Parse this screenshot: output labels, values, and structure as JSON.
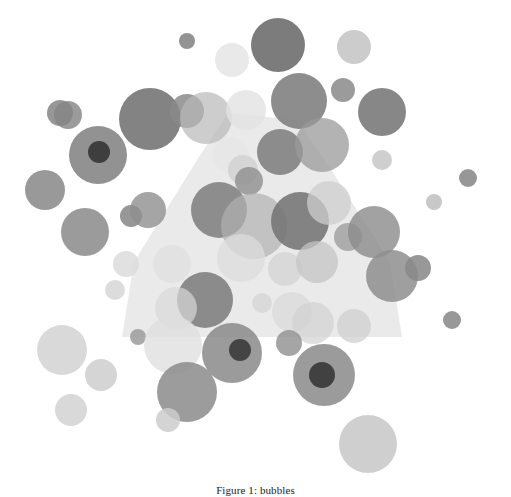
{
  "figure": {
    "caption": "Figure 1: bubbles",
    "background_color": "#ffffff"
  },
  "chart_data": {
    "type": "scatter",
    "title": "",
    "subtitle": "",
    "xlabel": "",
    "ylabel": "",
    "xlim": [
      0,
      511
    ],
    "ylim": [
      0,
      470
    ],
    "grid": false,
    "legend": "none",
    "axes_visible": false,
    "ticks": [],
    "tick_labels": [],
    "annotations": [],
    "marker_shape": "circle",
    "marker_colors": [
      "#808080",
      "#d9d9d9",
      "#a6a6a6",
      "#bfbfbf",
      "#737373"
    ],
    "marker_opacity_range": [
      0.45,
      0.95
    ],
    "overlay_shapes": [
      {
        "name": "light-polygon-hull",
        "type": "polygon",
        "color": "#d9d9d9",
        "opacity": 0.55,
        "points": "228,113 197,160 134,262 122,337 402,337 390,262 330,168 297,120"
      }
    ],
    "points": [
      {
        "x": 187,
        "y": 41,
        "r": 8,
        "c": "#808080",
        "o": 0.85
      },
      {
        "x": 278,
        "y": 45,
        "r": 27,
        "c": "#6e6e6e",
        "o": 0.9
      },
      {
        "x": 354,
        "y": 47,
        "r": 17,
        "c": "#c9c9c9",
        "o": 0.95
      },
      {
        "x": 68,
        "y": 115,
        "r": 14,
        "c": "#8a8a8a",
        "o": 0.85
      },
      {
        "x": 150,
        "y": 119,
        "r": 31,
        "c": "#757575",
        "o": 0.9
      },
      {
        "x": 187,
        "y": 111,
        "r": 17,
        "c": "#8a8a8a",
        "o": 0.85
      },
      {
        "x": 206,
        "y": 118,
        "r": 26,
        "c": "#b8b8b8",
        "o": 0.7
      },
      {
        "x": 246,
        "y": 110,
        "r": 20,
        "c": "#e2e2e2",
        "o": 0.8
      },
      {
        "x": 299,
        "y": 101,
        "r": 28,
        "c": "#7d7d7d",
        "o": 0.88
      },
      {
        "x": 343,
        "y": 90,
        "r": 12,
        "c": "#8a8a8a",
        "o": 0.85
      },
      {
        "x": 382,
        "y": 112,
        "r": 24,
        "c": "#7a7a7a",
        "o": 0.9
      },
      {
        "x": 60,
        "y": 113,
        "r": 13,
        "c": "#858585",
        "o": 0.85
      },
      {
        "x": 98,
        "y": 155,
        "r": 29,
        "c": "#7f7f7f",
        "o": 0.85
      },
      {
        "x": 99,
        "y": 152,
        "r": 11,
        "c": "#3a3a3a",
        "o": 0.95
      },
      {
        "x": 45,
        "y": 190,
        "r": 20,
        "c": "#878787",
        "o": 0.85
      },
      {
        "x": 231,
        "y": 155,
        "r": 18,
        "c": "#e6e6e6",
        "o": 0.8
      },
      {
        "x": 243,
        "y": 170,
        "r": 15,
        "c": "#cfcfcf",
        "o": 0.75
      },
      {
        "x": 280,
        "y": 152,
        "r": 23,
        "c": "#7b7b7b",
        "o": 0.85
      },
      {
        "x": 322,
        "y": 145,
        "r": 27,
        "c": "#9a9a9a",
        "o": 0.75
      },
      {
        "x": 382,
        "y": 160,
        "r": 10,
        "c": "#c7c7c7",
        "o": 0.85
      },
      {
        "x": 468,
        "y": 178,
        "r": 9,
        "c": "#8c8c8c",
        "o": 0.9
      },
      {
        "x": 85,
        "y": 232,
        "r": 24,
        "c": "#8a8a8a",
        "o": 0.85
      },
      {
        "x": 131,
        "y": 216,
        "r": 11,
        "c": "#858585",
        "o": 0.85
      },
      {
        "x": 148,
        "y": 210,
        "r": 18,
        "c": "#8f8f8f",
        "o": 0.8
      },
      {
        "x": 219,
        "y": 210,
        "r": 28,
        "c": "#7c7c7c",
        "o": 0.85
      },
      {
        "x": 249,
        "y": 181,
        "r": 14,
        "c": "#8e8e8e",
        "o": 0.8
      },
      {
        "x": 254,
        "y": 226,
        "r": 33,
        "c": "#b0b0b0",
        "o": 0.7
      },
      {
        "x": 300,
        "y": 221,
        "r": 29,
        "c": "#747474",
        "o": 0.88
      },
      {
        "x": 329,
        "y": 203,
        "r": 22,
        "c": "#cdcdcd",
        "o": 0.75
      },
      {
        "x": 348,
        "y": 237,
        "r": 14,
        "c": "#9d9d9d",
        "o": 0.8
      },
      {
        "x": 374,
        "y": 232,
        "r": 26,
        "c": "#8b8b8b",
        "o": 0.8
      },
      {
        "x": 126,
        "y": 264,
        "r": 13,
        "c": "#dcdcdc",
        "o": 0.85
      },
      {
        "x": 172,
        "y": 264,
        "r": 19,
        "c": "#e0e0e0",
        "o": 0.8
      },
      {
        "x": 241,
        "y": 258,
        "r": 24,
        "c": "#dcdcdc",
        "o": 0.75
      },
      {
        "x": 285,
        "y": 269,
        "r": 17,
        "c": "#d4d4d4",
        "o": 0.8
      },
      {
        "x": 317,
        "y": 262,
        "r": 21,
        "c": "#c4c4c4",
        "o": 0.75
      },
      {
        "x": 392,
        "y": 276,
        "r": 26,
        "c": "#8e8e8e",
        "o": 0.85
      },
      {
        "x": 418,
        "y": 268,
        "r": 13,
        "c": "#8a8a8a",
        "o": 0.88
      },
      {
        "x": 205,
        "y": 300,
        "r": 28,
        "c": "#7a7a7a",
        "o": 0.85
      },
      {
        "x": 176,
        "y": 308,
        "r": 21,
        "c": "#d8d8d8",
        "o": 0.7
      },
      {
        "x": 262,
        "y": 303,
        "r": 10,
        "c": "#d6d6d6",
        "o": 0.8
      },
      {
        "x": 292,
        "y": 312,
        "r": 20,
        "c": "#dadada",
        "o": 0.75
      },
      {
        "x": 313,
        "y": 323,
        "r": 21,
        "c": "#d2d2d2",
        "o": 0.7
      },
      {
        "x": 354,
        "y": 326,
        "r": 17,
        "c": "#cfcfcf",
        "o": 0.75
      },
      {
        "x": 452,
        "y": 320,
        "r": 9,
        "c": "#8d8d8d",
        "o": 0.9
      },
      {
        "x": 62,
        "y": 350,
        "r": 25,
        "c": "#cfcfcf",
        "o": 0.8
      },
      {
        "x": 101,
        "y": 375,
        "r": 16,
        "c": "#cacaca",
        "o": 0.8
      },
      {
        "x": 71,
        "y": 410,
        "r": 16,
        "c": "#d0d0d0",
        "o": 0.8
      },
      {
        "x": 138,
        "y": 337,
        "r": 8,
        "c": "#9b9b9b",
        "o": 0.85
      },
      {
        "x": 173,
        "y": 345,
        "r": 29,
        "c": "#dedede",
        "o": 0.75
      },
      {
        "x": 232,
        "y": 353,
        "r": 30,
        "c": "#8a8a8a",
        "o": 0.85
      },
      {
        "x": 240,
        "y": 350,
        "r": 11,
        "c": "#3f3f3f",
        "o": 0.95
      },
      {
        "x": 187,
        "y": 392,
        "r": 30,
        "c": "#8b8b8b",
        "o": 0.85
      },
      {
        "x": 168,
        "y": 420,
        "r": 12,
        "c": "#cdcdcd",
        "o": 0.85
      },
      {
        "x": 324,
        "y": 375,
        "r": 31,
        "c": "#8a8a8a",
        "o": 0.85
      },
      {
        "x": 322,
        "y": 375,
        "r": 13,
        "c": "#3c3c3c",
        "o": 0.95
      },
      {
        "x": 368,
        "y": 444,
        "r": 29,
        "c": "#cacaca",
        "o": 0.9
      },
      {
        "x": 289,
        "y": 343,
        "r": 13,
        "c": "#8f8f8f",
        "o": 0.8
      },
      {
        "x": 232,
        "y": 60,
        "r": 17,
        "c": "#e3e3e3",
        "o": 0.8
      },
      {
        "x": 434,
        "y": 202,
        "r": 8,
        "c": "#b0b0b0",
        "o": 0.7
      },
      {
        "x": 115,
        "y": 290,
        "r": 10,
        "c": "#d3d3d3",
        "o": 0.8
      }
    ]
  }
}
